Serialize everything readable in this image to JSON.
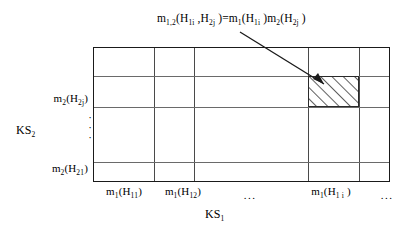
{
  "figure": {
    "type": "matrix-diagram",
    "top_formula": {
      "lhs": {
        "fn": "m",
        "fn_sub": "1,2",
        "args": [
          {
            "sym": "H",
            "sub": "1i"
          },
          {
            "sym": "H",
            "sub": "2j"
          }
        ]
      },
      "equals": "=",
      "rhs": [
        {
          "fn": "m",
          "fn_sub": "1",
          "arg": {
            "sym": "H",
            "sub": "1i"
          }
        },
        {
          "fn": "m",
          "fn_sub": "2",
          "arg": {
            "sym": "H",
            "sub": "2j"
          }
        }
      ],
      "plain_text": "m1,2(H1i,H2j) = m1(H1i)m2(H2j)"
    },
    "grid": {
      "columns": 5,
      "rows": 4,
      "v_line_positions": [
        60,
        100,
        214,
        265
      ],
      "h_line_positions": [
        28,
        59,
        114
      ],
      "highlight_cell": {
        "column_index": 3,
        "row_index": 1,
        "fill": "diagonal-hatch",
        "hatch_color": "#1a1a1a"
      },
      "border_color": "#1a1a1a",
      "line_color": "#5a5a5a"
    },
    "y_axis": {
      "title": {
        "sym": "KS",
        "sub": "2"
      },
      "title_plain": "KS2",
      "labels": [
        {
          "fn": "m",
          "fn_sub": "2",
          "arg": {
            "sym": "H",
            "sub": "2j"
          },
          "plain_text": "m2(H2j)"
        },
        {
          "fn": "m",
          "fn_sub": "2",
          "arg": {
            "sym": "H",
            "sub": "21"
          },
          "plain_text": "m2(H21)"
        }
      ],
      "ellipsis_dots": [
        "·",
        "·",
        "·"
      ]
    },
    "x_axis": {
      "title": {
        "sym": "KS",
        "sub": "1"
      },
      "title_plain": "KS1",
      "labels": [
        {
          "fn": "m",
          "fn_sub": "1",
          "arg": {
            "sym": "H",
            "sub": "11"
          },
          "plain_text": "m1(H11)"
        },
        {
          "fn": "m",
          "fn_sub": "1",
          "arg": {
            "sym": "H",
            "sub": "12"
          },
          "plain_text": "m1(H12)"
        },
        {
          "fn": "m",
          "fn_sub": "1",
          "arg": {
            "sym": "H",
            "sub": "1 i"
          },
          "plain_text": "m1(H1i)"
        }
      ],
      "ellipsis_mid": "...",
      "ellipsis_end": "..."
    },
    "annotation": {
      "kind": "arrow",
      "from": "top_formula",
      "to": "highlight_cell",
      "color": "#1a1a1a"
    }
  }
}
